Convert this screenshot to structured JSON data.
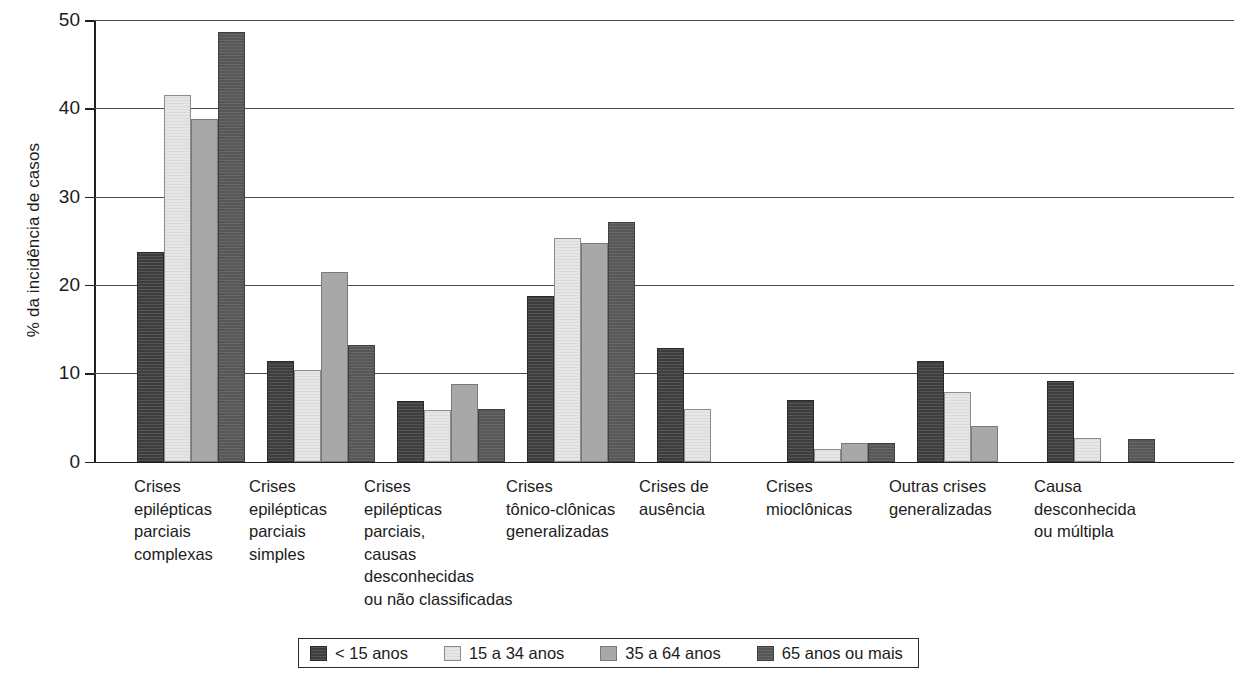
{
  "chart_data": {
    "type": "bar",
    "title": "",
    "xlabel": "",
    "ylabel": "% da incidência de casos",
    "ylim": [
      0,
      50
    ],
    "yticks": [
      0,
      10,
      20,
      30,
      40,
      50
    ],
    "ytick_labels": [
      "0",
      "10",
      "20",
      "30",
      "40",
      "50"
    ],
    "grid": true,
    "legend_position": "bottom",
    "categories": [
      "Crises epilépticas parciais complexas",
      "Crises epilépticas parciais simples",
      "Crises epilépticas parciais, causas desconhecidas ou não classificadas",
      "Crises tônico-clônicas generalizadas",
      "Crises de ausência",
      "Crises mioclônicas",
      "Outras crises generalizadas",
      "Causa desconhecida ou múltipla"
    ],
    "category_lines": [
      [
        "Crises",
        "epilépticas",
        "parciais",
        "complexas"
      ],
      [
        "Crises",
        "epilépticas",
        "parciais",
        "simples"
      ],
      [
        "Crises",
        "epilépticas",
        "parciais,",
        "causas",
        "desconhecidas",
        "ou não classificadas"
      ],
      [
        "Crises",
        "tônico-clônicas",
        "generalizadas"
      ],
      [
        "Crises de",
        "ausência"
      ],
      [
        "Crises",
        "mioclônicas"
      ],
      [
        "Outras crises",
        "generalizadas"
      ],
      [
        "Causa",
        "desconhecida",
        "ou múltipla"
      ]
    ],
    "series": [
      {
        "name": "< 15 anos",
        "color": "#3d3d3d",
        "values": [
          23.7,
          11.4,
          6.9,
          18.8,
          12.9,
          7.0,
          11.4,
          9.1
        ]
      },
      {
        "name": "15 a 34 anos",
        "color": "#e6e6e6",
        "values": [
          41.5,
          10.4,
          5.8,
          25.3,
          6.0,
          1.4,
          7.9,
          2.7
        ]
      },
      {
        "name": "35 a 64 anos",
        "color": "#a8a8a8",
        "values": [
          38.8,
          21.5,
          8.8,
          24.7,
          0,
          2.1,
          4.0,
          0
        ]
      },
      {
        "name": "65 anos ou mais",
        "color": "#575757",
        "values": [
          48.6,
          13.2,
          6.0,
          27.1,
          0,
          2.1,
          0,
          2.6
        ]
      }
    ]
  },
  "legend": {
    "items": [
      {
        "label": "< 15 anos"
      },
      {
        "label": "15 a 34 anos"
      },
      {
        "label": "35 a 64 anos"
      },
      {
        "label": "65 anos ou mais"
      }
    ]
  }
}
